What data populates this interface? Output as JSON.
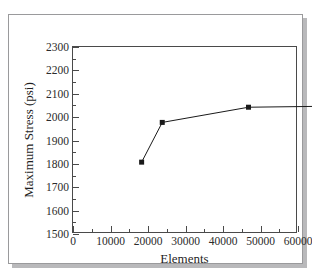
{
  "figure": {
    "cut_caption": "",
    "frame_color": "#9a9a9c",
    "shadow_color": "#b9b9bb",
    "background": "#ffffff"
  },
  "chart_data": {
    "type": "line",
    "title": "",
    "xlabel": "Elements",
    "ylabel": "Maximum Stress (psi)",
    "xlim": [
      0,
      60000
    ],
    "ylim": [
      1500,
      2300
    ],
    "grid": false,
    "legend": null,
    "xticks": [
      0,
      10000,
      20000,
      30000,
      40000,
      50000,
      60000
    ],
    "xtick_labels": [
      "0",
      "10000",
      "20000",
      "30000",
      "40000",
      "50000",
      "60000"
    ],
    "yticks": [
      1500,
      1600,
      1700,
      1800,
      1900,
      2000,
      2100,
      2200,
      2300
    ],
    "ytick_labels": [
      "1500",
      "1600",
      "1700",
      "1800",
      "1900",
      "2000",
      "2100",
      "2200",
      "2300"
    ],
    "x_minor_ticks": [
      5000,
      15000,
      25000,
      35000,
      45000,
      55000
    ],
    "y_minor_ticks": [
      1550,
      1650,
      1750,
      1850,
      1950,
      2050,
      2150,
      2250
    ],
    "series": [
      {
        "name": "Maximum Stress",
        "marker": "square",
        "marker_color": "#1a1a1a",
        "line_color": "#1a1a1a",
        "x": [
          1500,
          7000,
          30000,
          55000
        ],
        "values": [
          1940,
          2110,
          2175,
          2180
        ]
      }
    ]
  }
}
